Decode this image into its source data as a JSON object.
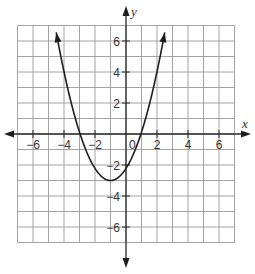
{
  "chart_data": {
    "type": "line",
    "title": "",
    "xlabel": "x",
    "ylabel": "y",
    "xlim": [
      -7,
      7
    ],
    "ylim": [
      -7,
      7
    ],
    "grid": true,
    "x_ticks": [
      -6,
      -4,
      -2,
      2,
      4,
      6
    ],
    "y_ticks": [
      -6,
      -4,
      -2,
      2,
      4,
      6
    ],
    "origin_label": "0",
    "series": [
      {
        "name": "parabola",
        "equation": "y = a(x + 1)^2 - 3",
        "vertex": [
          -1,
          -3
        ],
        "a": 0.78,
        "x_range": [
          -4.5,
          2.5
        ],
        "arrows_at_ends": true,
        "approx_x_intercepts": [
          -2.96,
          0.96
        ],
        "approx_y_intercept": -2.2
      }
    ]
  }
}
